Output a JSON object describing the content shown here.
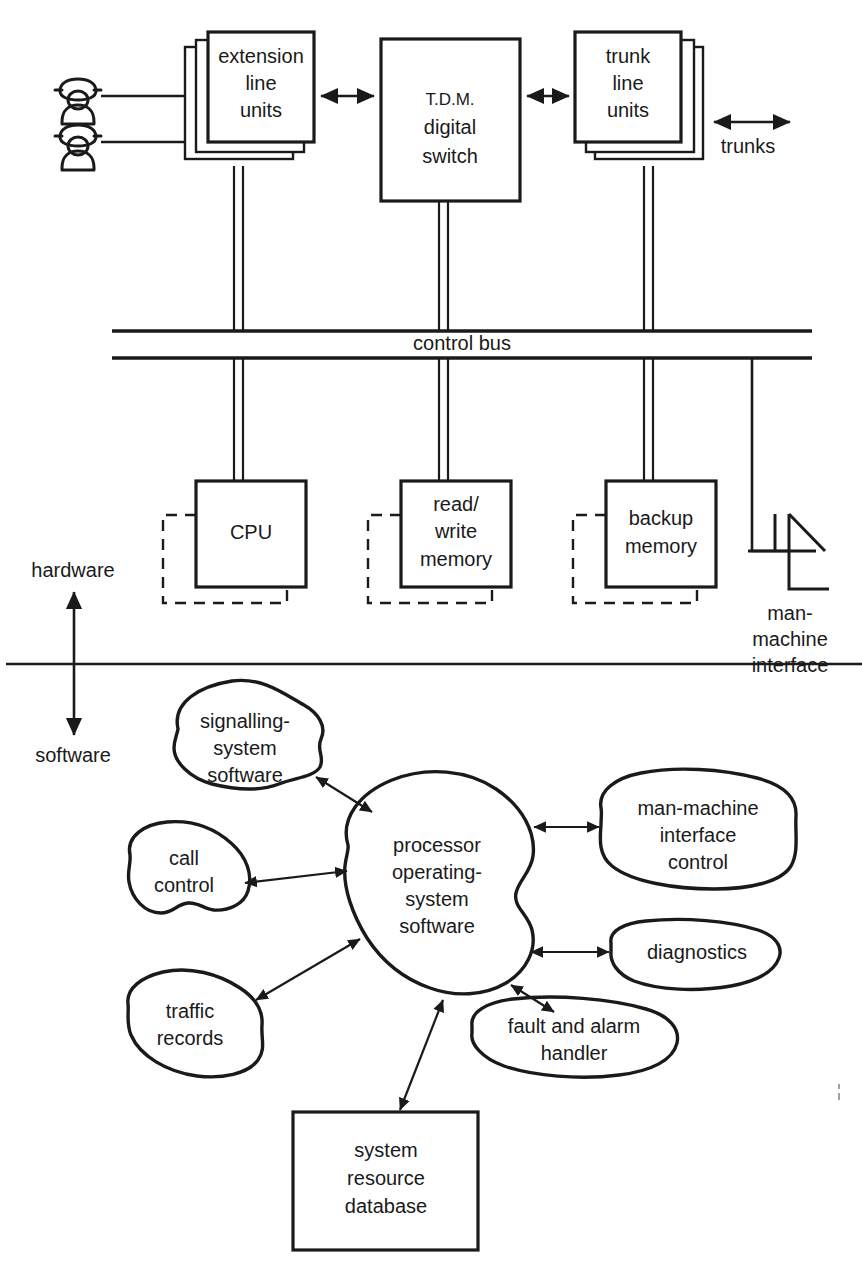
{
  "diagram": {
    "layers": {
      "hardware_label": "hardware",
      "software_label": "software"
    },
    "hardware": {
      "terminals": [
        {
          "name": "extension-line-units",
          "lines": [
            "extension",
            "line",
            "units"
          ]
        },
        {
          "name": "tdm-digital-switch",
          "lines": [
            "T.D.M.",
            "digital",
            "switch"
          ]
        },
        {
          "name": "trunk-line-units",
          "lines": [
            "trunk",
            "line",
            "units"
          ]
        }
      ],
      "trunks_label": "trunks",
      "bus_label": "control bus",
      "processing_units": [
        {
          "name": "cpu",
          "lines": [
            "CPU"
          ]
        },
        {
          "name": "read-write-memory",
          "lines": [
            "read/",
            "write",
            "memory"
          ]
        },
        {
          "name": "backup-memory",
          "lines": [
            "backup",
            "memory"
          ]
        }
      ],
      "man_machine_interface": {
        "lines": [
          "man-",
          "machine",
          "interface"
        ]
      },
      "phones": [
        {
          "name": "telephone-1"
        },
        {
          "name": "telephone-2"
        }
      ]
    },
    "software": {
      "modules": [
        {
          "name": "signalling-system-software",
          "lines": [
            "signalling-",
            "system",
            "software"
          ]
        },
        {
          "name": "call-control",
          "lines": [
            "call",
            "control"
          ]
        },
        {
          "name": "traffic-records",
          "lines": [
            "traffic",
            "records"
          ]
        },
        {
          "name": "processor-operating-system-software",
          "lines": [
            "processor",
            "operating-",
            "system",
            "software"
          ]
        },
        {
          "name": "man-machine-interface-control",
          "lines": [
            "man-machine",
            "interface",
            "control"
          ]
        },
        {
          "name": "diagnostics",
          "lines": [
            "diagnostics"
          ]
        },
        {
          "name": "fault-and-alarm-handler",
          "lines": [
            "fault and alarm",
            "handler"
          ]
        },
        {
          "name": "system-resource-database",
          "lines": [
            "system",
            "resource",
            "database"
          ]
        }
      ]
    },
    "colors": {
      "ink": "#1a1a1a",
      "paper": "#ffffff"
    }
  }
}
